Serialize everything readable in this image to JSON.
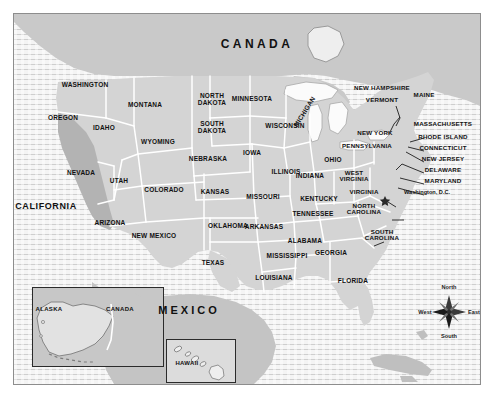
{
  "map": {
    "title_countries": [
      {
        "name": "CANADA",
        "x": 257,
        "y": 44
      },
      {
        "name": "MEXICO",
        "x": 189,
        "y": 311
      }
    ],
    "highlighted_state": "CALIFORNIA",
    "colors": {
      "land": "#d4d4d4",
      "land_highlight": "#b3b3b3",
      "border": "#ffffff",
      "lake": "#fbfbfb",
      "ocean": "#f4f4f4",
      "frame": "#8d8d8d",
      "label": "#111111"
    },
    "states": [
      {
        "name": "WASHINGTON",
        "x": 85,
        "y": 85
      },
      {
        "name": "OREGON",
        "x": 63,
        "y": 118
      },
      {
        "name": "IDAHO",
        "x": 104,
        "y": 128
      },
      {
        "name": "MONTANA",
        "x": 145,
        "y": 105
      },
      {
        "name": "WYOMING",
        "x": 158,
        "y": 142
      },
      {
        "name": "NEVADA",
        "x": 81,
        "y": 173
      },
      {
        "name": "UTAH",
        "x": 119,
        "y": 181
      },
      {
        "name": "COLORADO",
        "x": 164,
        "y": 190
      },
      {
        "name": "ARIZONA",
        "x": 110,
        "y": 223
      },
      {
        "name": "NEW MEXICO",
        "x": 154,
        "y": 236
      },
      {
        "name": "NORTH\nDAKOTA",
        "x": 212,
        "y": 100
      },
      {
        "name": "SOUTH\nDAKOTA",
        "x": 212,
        "y": 128
      },
      {
        "name": "NEBRASKA",
        "x": 208,
        "y": 159
      },
      {
        "name": "KANSAS",
        "x": 215,
        "y": 192
      },
      {
        "name": "OKLAHOMA",
        "x": 228,
        "y": 226
      },
      {
        "name": "TEXAS",
        "x": 213,
        "y": 263
      },
      {
        "name": "MINNESOTA",
        "x": 252,
        "y": 99
      },
      {
        "name": "IOWA",
        "x": 252,
        "y": 153
      },
      {
        "name": "MISSOURI",
        "x": 263,
        "y": 197
      },
      {
        "name": "ARKANSAS",
        "x": 264,
        "y": 227
      },
      {
        "name": "LOUISIANA",
        "x": 274,
        "y": 278
      },
      {
        "name": "WISCONSIN",
        "x": 285,
        "y": 126
      },
      {
        "name": "ILLINOIS",
        "x": 286,
        "y": 172
      },
      {
        "name": "MISSISSIPPI",
        "x": 287,
        "y": 256
      },
      {
        "name": "ALABAMA",
        "x": 305,
        "y": 241
      },
      {
        "name": "INDIANA",
        "x": 310,
        "y": 176
      },
      {
        "name": "MICHIGAN",
        "x": 305,
        "y": 112
      },
      {
        "name": "KENTUCKY",
        "x": 319,
        "y": 199
      },
      {
        "name": "TENNESSEE",
        "x": 313,
        "y": 214
      },
      {
        "name": "OHIO",
        "x": 333,
        "y": 160
      },
      {
        "name": "GEORGIA",
        "x": 331,
        "y": 253
      },
      {
        "name": "FLORIDA",
        "x": 353,
        "y": 281
      },
      {
        "name": "WEST\nVIRGINIA",
        "x": 354,
        "y": 176
      },
      {
        "name": "VIRGINIA",
        "x": 364,
        "y": 192
      },
      {
        "name": "NORTH\nCAROLINA",
        "x": 364,
        "y": 209
      },
      {
        "name": "SOUTH\nCAROLINA",
        "x": 382,
        "y": 235
      },
      {
        "name": "PENNSYLVANIA",
        "x": 367,
        "y": 146
      },
      {
        "name": "NEW YORK",
        "x": 375,
        "y": 133
      },
      {
        "name": "VERMONT",
        "x": 382,
        "y": 100
      },
      {
        "name": "NEW HAMPSHIRE",
        "x": 382,
        "y": 88
      },
      {
        "name": "MAINE",
        "x": 424,
        "y": 95
      }
    ],
    "callout_states": [
      {
        "name": "MASSACHUSETTS",
        "x": 443,
        "y": 124
      },
      {
        "name": "RHODE ISLAND",
        "x": 443,
        "y": 137
      },
      {
        "name": "CONNECTICUT",
        "x": 443,
        "y": 148
      },
      {
        "name": "NEW JERSEY",
        "x": 443,
        "y": 159
      },
      {
        "name": "DELAWARE",
        "x": 443,
        "y": 170
      },
      {
        "name": "MARYLAND",
        "x": 443,
        "y": 181
      }
    ],
    "capital": {
      "label": "Washington, D.C.",
      "x": 427,
      "y": 193
    },
    "compass": {
      "north": "North",
      "south": "South",
      "east": "East",
      "west": "West"
    },
    "insets": [
      {
        "id": "alaska",
        "labels": [
          {
            "name": "ALASKA",
            "x": 48,
            "y": 308
          },
          {
            "name": "CANADA",
            "x": 119,
            "y": 308
          }
        ]
      },
      {
        "id": "hawaii",
        "labels": [
          {
            "name": "HAWAII",
            "x": 186,
            "y": 362
          }
        ]
      }
    ]
  }
}
